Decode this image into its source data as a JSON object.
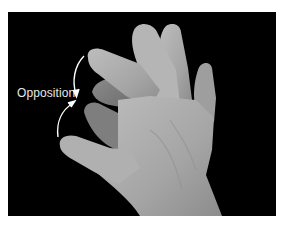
{
  "figure": {
    "annotation_label": "Opposition",
    "background_color": "#000000",
    "skin_tone": "#a9a9a9",
    "arrow_color": "#ffffff"
  }
}
